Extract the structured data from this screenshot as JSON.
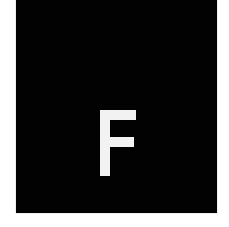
{
  "tile": {
    "letter": "F",
    "background_color": "#020202",
    "letter_color": "#f2f2f2",
    "page_background": "#ffffff"
  }
}
